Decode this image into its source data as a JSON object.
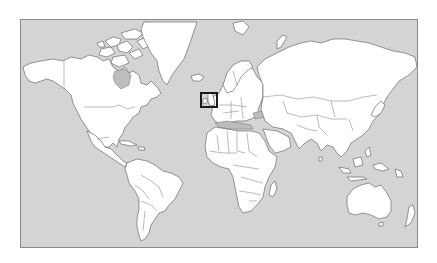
{
  "map": {
    "type": "world-political-outline",
    "projection": "Mercator",
    "colors": {
      "ocean": "#d4d4d4",
      "land": "#ffffff",
      "borders": "#555555",
      "frame": "#8a8a8a",
      "highlight": "#1a1a1a",
      "page_background": "#ffffff"
    },
    "highlight": {
      "region": "British Isles (United Kingdom and Ireland)",
      "box": {
        "left": 199,
        "top": 91,
        "width": 18,
        "height": 16
      }
    },
    "continents": [
      "North America",
      "South America",
      "Europe",
      "Africa",
      "Asia",
      "Oceania",
      "Greenland"
    ]
  }
}
